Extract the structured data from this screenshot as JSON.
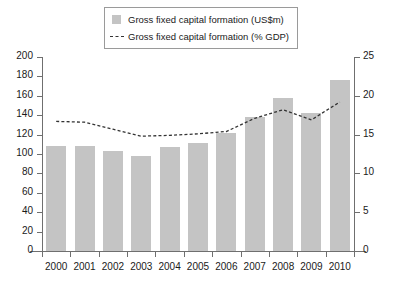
{
  "legend": {
    "items": [
      {
        "marker": "bar-swatch",
        "label": "Gross fixed capital formation (US$m)"
      },
      {
        "marker": "dashed-line",
        "label": "Gross fixed capital formation (% GDP)"
      }
    ]
  },
  "colors": {
    "bar_fill": "#c4c4c4",
    "line": "#333333",
    "axis": "#6f6f6f",
    "text": "#1a1a1a",
    "background": "#ffffff"
  },
  "chart_data": {
    "type": "bar",
    "title": "",
    "xlabel": "",
    "ylabel": "",
    "grid": false,
    "legend_position": "top-center",
    "categories": [
      "2000",
      "2001",
      "2002",
      "2003",
      "2004",
      "2005",
      "2006",
      "2007",
      "2008",
      "2009",
      "2010"
    ],
    "axes": {
      "left": {
        "label": "Gross fixed capital formation (US$m)",
        "ylim": [
          0,
          200
        ],
        "ticks": [
          0,
          20,
          40,
          60,
          80,
          100,
          120,
          140,
          160,
          180,
          200
        ],
        "tick_labels": [
          "0",
          "20",
          "40",
          "60",
          "80",
          "100",
          "120",
          "140",
          "160",
          "180",
          "200"
        ]
      },
      "right": {
        "label": "Gross fixed capital formation (% GDP)",
        "ylim": [
          0,
          25
        ],
        "ticks": [
          0,
          5,
          10,
          15,
          20,
          25
        ],
        "tick_labels": [
          "0",
          "5",
          "10",
          "15",
          "20",
          "25"
        ]
      }
    },
    "series": [
      {
        "name": "Gross fixed capital formation (US$m)",
        "type": "bar",
        "axis": "left",
        "values": [
          108,
          108,
          103,
          98,
          107,
          111,
          122,
          138,
          158,
          142,
          176
        ]
      },
      {
        "name": "Gross fixed capital formation (% GDP)",
        "type": "line",
        "axis": "right",
        "style": "dashed",
        "values": [
          16.7,
          16.6,
          15.7,
          14.8,
          14.9,
          15.1,
          15.4,
          17.1,
          18.2,
          16.9,
          19.2
        ]
      }
    ]
  }
}
